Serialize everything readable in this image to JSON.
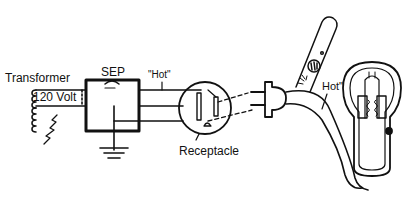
{
  "diagram": {
    "labels": {
      "transformer": "Transformer",
      "voltage": "120 Volt",
      "sep": "SEP",
      "hot_left": "\"Hot\"",
      "receptacle": "Receptacle",
      "hot_right": "Hot\""
    },
    "colors": {
      "ink": "#111111",
      "background": "#ffffff"
    }
  }
}
